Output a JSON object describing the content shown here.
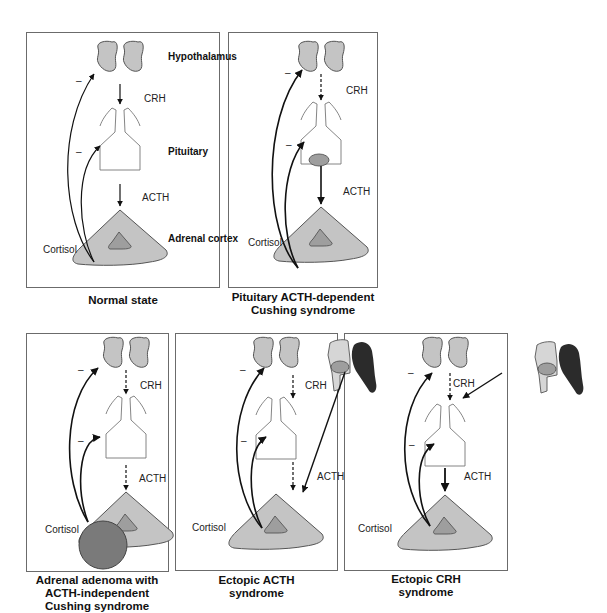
{
  "colors": {
    "gland_fill": "#c4c4c4",
    "gland_stroke": "#555555",
    "inner_fill": "#9e9e9e",
    "adenoma_fill": "#7a7a7a",
    "tumor_dark": "#2b2b2b",
    "tumor_light": "#d6d6d6",
    "panel_border": "#6b6b6b"
  },
  "labels": {
    "hypothalamus": "Hypothalamus",
    "pituitary": "Pituitary",
    "adrenal_cortex": "Adrenal cortex",
    "crh": "CRH",
    "acth": "ACTH",
    "cortisol": "Cortisol",
    "inhibit": "–"
  },
  "panels": [
    {
      "id": "normal",
      "caption": [
        "Normal state"
      ]
    },
    {
      "id": "pituitary",
      "caption": [
        "Pituitary ACTH-dependent",
        "Cushing syndrome"
      ]
    },
    {
      "id": "adrenal",
      "caption": [
        "Adrenal adenoma with",
        "ACTH-independent",
        "Cushing syndrome"
      ]
    },
    {
      "id": "ectopic-acth",
      "caption": [
        "Ectopic ACTH",
        "syndrome"
      ]
    },
    {
      "id": "ectopic-crh",
      "caption": [
        "Ectopic CRH",
        "syndrome"
      ]
    }
  ]
}
